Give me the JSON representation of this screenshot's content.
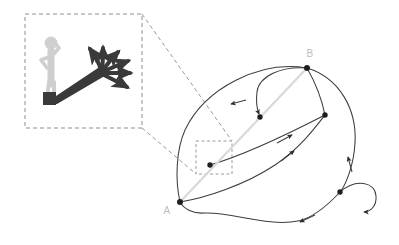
{
  "figure": {
    "background_color": "#ffffff"
  },
  "colors": {
    "graph_stroke": "#3d3d3d",
    "node_fill": "#1f1f1f",
    "label_gray": "#bdbdbd",
    "shadow_dark": "#3a3a3a",
    "figure_gray": "#cccccc",
    "figure_gray_dark": "#b4b4b4",
    "dashed_gray": "#9a9a9a",
    "highlight_arrow": "#d4d4d4"
  },
  "inset": {
    "name": "magnified-inset",
    "box": {
      "x": 25,
      "y": 14,
      "width": 117,
      "height": 114
    },
    "person": {
      "name": "stick-figure",
      "color": "#cccccc",
      "head_cx": 51,
      "head_cy": 43,
      "head_r": 6.5
    },
    "shadow": {
      "name": "branching-shadow",
      "color": "#3a3a3a",
      "branch_count": 6,
      "description": "cast shadow fanning out into multiple arrow branches"
    }
  },
  "zoom_links": {
    "name": "zoom-connector-lines",
    "color": "#9a9a9a",
    "target_box": {
      "x": 196,
      "y": 141,
      "width": 36,
      "height": 33
    }
  },
  "graph": {
    "name": "state-transition-graph",
    "nodes": [
      {
        "id": "A",
        "label": "A",
        "x": 180,
        "y": 202,
        "r": 2.8,
        "label_x": 170,
        "label_y": 212,
        "labeled": true
      },
      {
        "id": "B",
        "label": "B",
        "x": 307,
        "y": 68,
        "r": 2.8,
        "label_x": 309,
        "label_y": 58,
        "labeled": true
      },
      {
        "id": "n1",
        "label": "",
        "x": 210,
        "y": 165,
        "r": 2.6,
        "labeled": false
      },
      {
        "id": "n2",
        "label": "",
        "x": 260,
        "y": 117,
        "r": 2.6,
        "labeled": false
      },
      {
        "id": "n3",
        "label": "",
        "x": 325,
        "y": 115,
        "r": 2.6,
        "labeled": false
      },
      {
        "id": "n4",
        "label": "",
        "x": 340,
        "y": 192,
        "r": 2.6,
        "labeled": false
      }
    ],
    "edges": [
      {
        "from": "A",
        "to": "B",
        "kind": "highlight",
        "note": "straight light-gray highlighted trajectory with mid arrowhead"
      },
      {
        "from": "B",
        "to": "A",
        "kind": "curve",
        "note": "wide upper-left arc, arrow pointing left"
      },
      {
        "from": "B",
        "to": "n2",
        "kind": "curve",
        "note": "short hook, arrow into n2"
      },
      {
        "from": "n1",
        "to": "n3",
        "kind": "curve",
        "note": "rising arc with right arrow"
      },
      {
        "from": "A",
        "to": "n3",
        "kind": "curve",
        "note": "lower sweeping arc with up-right arrow"
      },
      {
        "from": "B",
        "to": "n3",
        "kind": "curve",
        "note": "short link down from B"
      },
      {
        "from": "B",
        "to": "n4",
        "kind": "curve",
        "note": "long right-hand arc with upward arrow"
      },
      {
        "from": "n4",
        "to": "n4",
        "kind": "self-loop",
        "note": "self transition loop with arrow"
      },
      {
        "from": "n4",
        "to": "A",
        "kind": "curve",
        "note": "bottom arc back to A with left arrow"
      }
    ],
    "self_loop": {
      "node": "n4",
      "cx": 358,
      "cy": 195,
      "rx": 19,
      "ry": 21
    }
  }
}
